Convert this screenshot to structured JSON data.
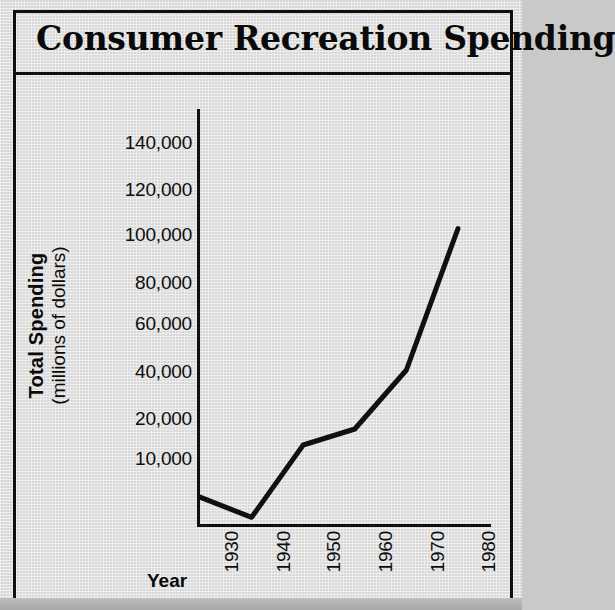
{
  "figure": {
    "title": "Consumer Recreation Spending",
    "background_color": "#d8d8d8",
    "border_color": "#101010",
    "line_color": "#101010"
  },
  "axes": {
    "x_title": "Year",
    "y_title_line1": "Total Spending",
    "y_title_line2": "(millions of dollars)",
    "y_tick_labels": [
      "140,000",
      "120,000",
      "100,000",
      "80,000",
      "60,000",
      "40,000",
      "20,000",
      "10,000"
    ],
    "x_tick_labels": [
      "1930",
      "1940",
      "1950",
      "1960",
      "1970",
      "1980"
    ]
  },
  "chart_data": {
    "type": "line",
    "title": "Consumer Recreation Spending",
    "xlabel": "Year",
    "ylabel": "Total Spending (millions of dollars)",
    "x": [
      1930,
      1940,
      1950,
      1960,
      1970,
      1980
    ],
    "values": [
      4000,
      1000,
      13000,
      17000,
      40000,
      102000
    ],
    "series": [
      {
        "name": "Total Spending",
        "values": [
          4000,
          1000,
          13000,
          17000,
          40000,
          102000
        ]
      }
    ],
    "xlim": [
      1925,
      1985
    ],
    "ylim": [
      0,
      150000
    ],
    "ytick_values": [
      140000,
      120000,
      100000,
      80000,
      60000,
      40000,
      20000,
      10000
    ],
    "xtick_values": [
      1930,
      1940,
      1950,
      1960,
      1970,
      1980
    ],
    "grid": false,
    "legend": false,
    "legend_position": "none",
    "note": "y-axis tick spacing is uniform in the printed figure although 20,000 and 10,000 are not evenly valued"
  }
}
